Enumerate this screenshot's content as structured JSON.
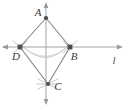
{
  "figure": {
    "type": "geometry-construction",
    "background_color": "#ffffff",
    "stroke_color": "#7a7a7a",
    "axis_color": "#9a9a9a",
    "arc_color": "#b0b0b0",
    "marker_color": "#555555",
    "label_color": "#3a3a3a",
    "points": [
      {
        "name": "A",
        "label": "A",
        "x": 46,
        "y": 18,
        "label_x": 38,
        "label_y": 16,
        "marker": "dot"
      },
      {
        "name": "B",
        "label": "B",
        "x": 70,
        "y": 47,
        "label_x": 71,
        "label_y": 59,
        "marker": "square"
      },
      {
        "name": "C",
        "label": "C",
        "x": 48,
        "y": 84,
        "label_x": 55,
        "label_y": 86,
        "marker": "dot"
      },
      {
        "name": "D",
        "label": "D",
        "x": 20,
        "y": 47,
        "label_x": 12,
        "label_y": 59,
        "marker": "square"
      }
    ],
    "lines": [
      {
        "name": "line-l",
        "label": "l",
        "label_x": 113,
        "label_y": 62,
        "orientation": "horizontal",
        "x1": 2,
        "y1": 47,
        "x2": 122,
        "y2": 47,
        "arrows": "both"
      },
      {
        "name": "vertical-axis",
        "label": "",
        "orientation": "vertical",
        "x1": 46,
        "y1": 3,
        "x2": 46,
        "y2": 104,
        "arrows": "both"
      }
    ],
    "segments": [
      {
        "name": "segment-AD",
        "from": "A",
        "to": "D"
      },
      {
        "name": "segment-AB",
        "from": "A",
        "to": "B"
      },
      {
        "name": "segment-DC",
        "from": "D",
        "to": "C"
      },
      {
        "name": "segment-BC",
        "from": "B",
        "to": "C"
      }
    ],
    "arcs": [
      {
        "name": "arc-from-D",
        "center": "D",
        "sweep": "right-downward"
      },
      {
        "name": "arc-from-B",
        "center": "B",
        "sweep": "left-downward"
      }
    ],
    "construction_marks": [
      {
        "name": "tick-mark-A",
        "at": "A"
      },
      {
        "name": "tick-mark-B",
        "at": "B"
      },
      {
        "name": "tick-mark-C",
        "at": "C"
      },
      {
        "name": "tick-mark-D",
        "at": "D"
      }
    ]
  }
}
